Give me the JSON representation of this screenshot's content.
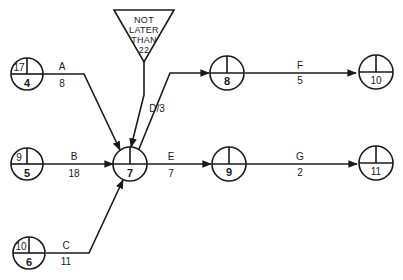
{
  "constraint": {
    "lines": [
      "NOT",
      "LATER",
      "THAN",
      "22"
    ]
  },
  "nodes": [
    {
      "id": "4",
      "number": "4",
      "early": "17"
    },
    {
      "id": "5",
      "number": "5",
      "early": "9"
    },
    {
      "id": "6",
      "number": "6",
      "early": "10"
    },
    {
      "id": "7",
      "number": "7",
      "early": ""
    },
    {
      "id": "8",
      "number": "8",
      "early": ""
    },
    {
      "id": "9",
      "number": "9",
      "early": ""
    },
    {
      "id": "10",
      "number": "10",
      "early": ""
    },
    {
      "id": "11",
      "number": "11",
      "early": ""
    }
  ],
  "activities": [
    {
      "label": "A",
      "duration": "8"
    },
    {
      "label": "B",
      "duration": "18"
    },
    {
      "label": "C",
      "duration": "11"
    },
    {
      "label": "D",
      "duration": "3",
      "combined": "D/3"
    },
    {
      "label": "E",
      "duration": "7"
    },
    {
      "label": "F",
      "duration": "5"
    },
    {
      "label": "G",
      "duration": "2"
    }
  ]
}
